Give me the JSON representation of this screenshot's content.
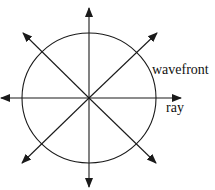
{
  "diagram": {
    "labels": {
      "wavefront": "wavefront",
      "ray": "ray"
    },
    "colors": {
      "stroke": "#1a1a1a",
      "background": "#ffffff"
    },
    "center": [
      89,
      98
    ],
    "wavefront_circle": {
      "rx": 67,
      "ry": 65
    },
    "rays": [
      {
        "direction": "up",
        "tip": [
          89,
          8
        ]
      },
      {
        "direction": "up-right",
        "tip": [
          157,
          33
        ]
      },
      {
        "direction": "right",
        "tip": [
          181,
          98
        ]
      },
      {
        "direction": "down-right",
        "tip": [
          156,
          163
        ]
      },
      {
        "direction": "down",
        "tip": [
          89,
          187
        ]
      },
      {
        "direction": "down-left",
        "tip": [
          22,
          163
        ]
      },
      {
        "direction": "left",
        "tip": [
          1,
          98
        ]
      },
      {
        "direction": "up-left",
        "tip": [
          23,
          33
        ]
      }
    ]
  }
}
